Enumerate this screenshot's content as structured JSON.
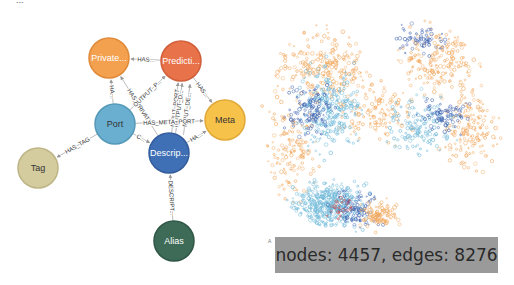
{
  "top_cut_text": "...",
  "schema": {
    "nodes": [
      {
        "id": "private",
        "label": "Private...",
        "x": 109,
        "y": 58,
        "r": 20,
        "fill": "#f3a04f",
        "stroke": "#e08a3a",
        "text_color": "#ffffff"
      },
      {
        "id": "prediction",
        "label": "Predicti...",
        "x": 181,
        "y": 61,
        "r": 20,
        "fill": "#e8724a",
        "stroke": "#d05f3a",
        "text_color": "#ffffff"
      },
      {
        "id": "meta",
        "label": "Meta",
        "x": 225,
        "y": 120,
        "r": 20,
        "fill": "#f7c24a",
        "stroke": "#e0a838",
        "text_color": "#333333"
      },
      {
        "id": "port",
        "label": "Port",
        "x": 115,
        "y": 124,
        "r": 20,
        "fill": "#6aafd0",
        "stroke": "#5598b8",
        "text_color": "#333333"
      },
      {
        "id": "description",
        "label": "Descrip...",
        "x": 169,
        "y": 153,
        "r": 20,
        "fill": "#3f6fb5",
        "stroke": "#335d9c",
        "text_color": "#ffffff"
      },
      {
        "id": "tag",
        "label": "Tag",
        "x": 38,
        "y": 168,
        "r": 20,
        "fill": "#d4cc9e",
        "stroke": "#bdb585",
        "text_color": "#333333"
      },
      {
        "id": "alias",
        "label": "Alias",
        "x": 174,
        "y": 241,
        "r": 20,
        "fill": "#3e6b57",
        "stroke": "#2f5646",
        "text_color": "#ffffff"
      }
    ],
    "edges": [
      {
        "from": "prediction",
        "to": "private",
        "label": "HAS..."
      },
      {
        "from": "port",
        "to": "private",
        "label": "HA..."
      },
      {
        "from": "description",
        "to": "private",
        "label": "HAS_PRIVATE"
      },
      {
        "from": "port",
        "to": "prediction",
        "label": "OUTPUT_P..."
      },
      {
        "from": "description",
        "to": "prediction",
        "label": "INPUT_PORT"
      },
      {
        "from": "description",
        "to": "prediction",
        "label": "OUTPUT_D..."
      },
      {
        "from": "prediction",
        "to": "meta",
        "label": "HAS..."
      },
      {
        "from": "description",
        "to": "prediction",
        "label": "INPUT_DE..."
      },
      {
        "from": "port",
        "to": "meta",
        "label": "HAS_META_PORT"
      },
      {
        "from": "description",
        "to": "meta",
        "label": "HA..."
      },
      {
        "from": "port",
        "to": "description",
        "label": "C..."
      },
      {
        "from": "port",
        "to": "tag",
        "label": "HAS_TAG"
      },
      {
        "from": "alias",
        "to": "description",
        "label": "DESCRIPT..."
      }
    ]
  },
  "cloud": {
    "seed": 7,
    "colors": {
      "orange": "#f2a85e",
      "light_blue": "#6db8d8",
      "dark_blue": "#3e62b0",
      "red": "#d24a4a"
    },
    "clusters": [
      {
        "cx": 320,
        "cy": 70,
        "rx": 50,
        "ry": 40,
        "n": 260,
        "color": "orange"
      },
      {
        "cx": 440,
        "cy": 60,
        "rx": 45,
        "ry": 35,
        "n": 200,
        "color": "orange"
      },
      {
        "cx": 470,
        "cy": 130,
        "rx": 30,
        "ry": 40,
        "n": 160,
        "color": "orange"
      },
      {
        "cx": 290,
        "cy": 150,
        "rx": 30,
        "ry": 50,
        "n": 140,
        "color": "orange"
      },
      {
        "cx": 380,
        "cy": 115,
        "rx": 40,
        "ry": 30,
        "n": 120,
        "color": "orange"
      },
      {
        "cx": 330,
        "cy": 110,
        "rx": 35,
        "ry": 45,
        "n": 260,
        "color": "light_blue"
      },
      {
        "cx": 420,
        "cy": 125,
        "rx": 35,
        "ry": 30,
        "n": 150,
        "color": "light_blue"
      },
      {
        "cx": 330,
        "cy": 205,
        "rx": 40,
        "ry": 25,
        "n": 420,
        "color": "light_blue"
      },
      {
        "cx": 310,
        "cy": 110,
        "rx": 25,
        "ry": 25,
        "n": 110,
        "color": "dark_blue"
      },
      {
        "cx": 445,
        "cy": 115,
        "rx": 25,
        "ry": 20,
        "n": 70,
        "color": "dark_blue"
      },
      {
        "cx": 355,
        "cy": 210,
        "rx": 25,
        "ry": 20,
        "n": 90,
        "color": "dark_blue"
      },
      {
        "cx": 420,
        "cy": 40,
        "rx": 25,
        "ry": 15,
        "n": 60,
        "color": "dark_blue"
      },
      {
        "cx": 340,
        "cy": 205,
        "rx": 18,
        "ry": 12,
        "n": 25,
        "color": "red"
      },
      {
        "cx": 380,
        "cy": 215,
        "rx": 20,
        "ry": 15,
        "n": 110,
        "color": "orange"
      },
      {
        "cx": 480,
        "cy": 225,
        "rx": 25,
        "ry": 8,
        "n": 20,
        "color": "light_blue"
      }
    ]
  },
  "stats": {
    "label": "nodes: 4457, edges: 8276",
    "nodes": 4457,
    "edges": 8276
  },
  "tiny_mark": "A"
}
